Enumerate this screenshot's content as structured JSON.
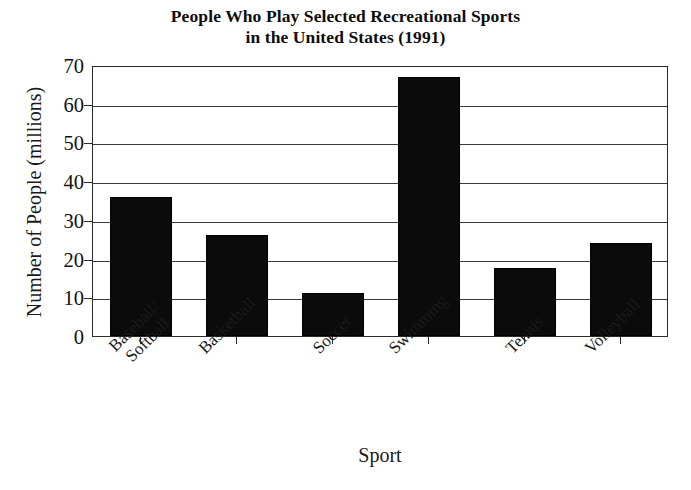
{
  "chart_data": {
    "type": "bar",
    "title": "People Who Play Selected Recreational Sports in the United States (1991)",
    "title_lines": [
      "People Who Play Selected Recreational Sports",
      "in the United States (1991)"
    ],
    "xlabel": "Sport",
    "ylabel": "Number of People (millions)",
    "categories": [
      "Baseball/Softball",
      "Basketball",
      "Soccer",
      "Swimming",
      "Tennis",
      "Volleyball"
    ],
    "category_lines": [
      [
        "Baseball/",
        "Softball"
      ],
      [
        "Basketball"
      ],
      [
        "Soccer"
      ],
      [
        "Swimming"
      ],
      [
        "Tennis"
      ],
      [
        "Volleyball"
      ]
    ],
    "values": [
      36,
      26,
      11,
      67,
      17.5,
      24
    ],
    "ylim": [
      0,
      70
    ],
    "ytick_labels": [
      "0",
      "10",
      "20",
      "30",
      "40",
      "50",
      "60",
      "70"
    ],
    "ytick_values": [
      0,
      10,
      20,
      30,
      40,
      50,
      60,
      70
    ],
    "grid": true,
    "grid_axis": "y",
    "legend": false,
    "bar_color": "#0b0b0b",
    "axis_color": "#2b2b2b",
    "background_color": "#ffffff",
    "xtick_label_rotation": -45
  }
}
